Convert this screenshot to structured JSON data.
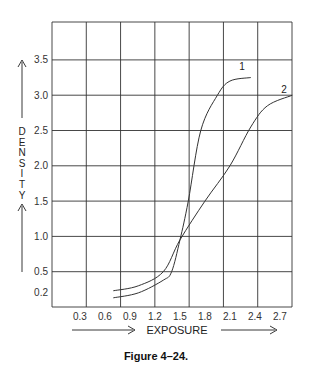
{
  "chart_data": {
    "type": "line",
    "title": "",
    "caption": "Figure 4–24.",
    "xlabel": "EXPOSURE",
    "ylabel": "DENSITY",
    "x_ticks": [
      "0.3",
      "0.6",
      "0.9",
      "1.2",
      "1.5",
      "1.8",
      "2.1",
      "2.4",
      "2.7"
    ],
    "y_ticks": [
      "0.2",
      "0.5",
      "1.0",
      "1.5",
      "2.0",
      "2.5",
      "3.0",
      "3.5"
    ],
    "xlim": [
      0.0,
      3.0
    ],
    "ylim": [
      0.0,
      4.0
    ],
    "grid": true,
    "legend": "inline curve labels",
    "series": [
      {
        "name": "1",
        "x": [
          0.7,
          1.0,
          1.3,
          1.4,
          1.5,
          1.6,
          1.75,
          1.95,
          2.1,
          2.35
        ],
        "y": [
          0.13,
          0.2,
          0.38,
          0.5,
          0.95,
          1.5,
          2.5,
          3.0,
          3.2,
          3.25
        ]
      },
      {
        "name": "2",
        "x": [
          0.7,
          1.0,
          1.3,
          1.5,
          1.8,
          2.1,
          2.35,
          2.55,
          2.85
        ],
        "y": [
          0.23,
          0.3,
          0.5,
          0.95,
          1.5,
          2.0,
          2.55,
          2.85,
          3.0
        ]
      }
    ]
  },
  "labels": {
    "density_letters": [
      "D",
      "E",
      "N",
      "S",
      "I",
      "T",
      "Y"
    ],
    "xlabel": "EXPOSURE",
    "curve1": "1",
    "curve2": "2",
    "caption": "Figure 4–24."
  }
}
